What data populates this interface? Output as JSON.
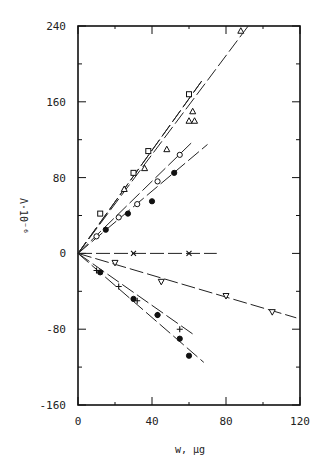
{
  "chart_data": {
    "type": "scatter",
    "title": "",
    "xlabel": "w, µg",
    "ylabel": "Λ·10⁻⁶",
    "xlim": [
      0,
      120
    ],
    "ylim": [
      -160,
      240
    ],
    "x_ticks": [
      0,
      40,
      80,
      120
    ],
    "y_ticks": [
      240,
      160,
      80,
      0,
      -80,
      -160
    ],
    "x_tick_labels": [
      "0",
      "40",
      "80",
      "120"
    ],
    "y_tick_labels": [
      "240",
      "160",
      "80",
      "0",
      "-80",
      "-160"
    ],
    "grid": false,
    "legend": "none",
    "series": [
      {
        "name": "open-triangle-steep",
        "marker": "triangle",
        "x": [
          60,
          62,
          63,
          88
        ],
        "y": [
          140,
          150,
          140,
          235
        ],
        "fit_end": [
          92,
          240
        ]
      },
      {
        "name": "open-square",
        "marker": "square",
        "x": [
          12,
          30,
          38,
          60
        ],
        "y": [
          42,
          85,
          108,
          168
        ],
        "fit_end": [
          68,
          185
        ]
      },
      {
        "name": "triangle-mid",
        "marker": "triangle",
        "x": [
          25,
          36,
          48
        ],
        "y": [
          68,
          90,
          110
        ],
        "fit_end": [
          68,
          185
        ]
      },
      {
        "name": "open-circle",
        "marker": "circle",
        "x": [
          10,
          22,
          32,
          43,
          55
        ],
        "y": [
          18,
          38,
          52,
          76,
          104
        ],
        "fit_end": [
          62,
          118
        ]
      },
      {
        "name": "filled-circle-pos",
        "marker": "filled-circle",
        "x": [
          15,
          27,
          40,
          52
        ],
        "y": [
          25,
          42,
          55,
          85
        ],
        "fit_end": [
          70,
          115
        ]
      },
      {
        "name": "cross-flat",
        "marker": "x",
        "x": [
          30,
          60
        ],
        "y": [
          0,
          0
        ],
        "fit_end": [
          75,
          0
        ]
      },
      {
        "name": "open-inverted-triangle",
        "marker": "triangle-down",
        "x": [
          20,
          45,
          80,
          105
        ],
        "y": [
          -10,
          -30,
          -45,
          -62
        ],
        "fit_end": [
          118,
          -68
        ]
      },
      {
        "name": "plus",
        "marker": "plus",
        "x": [
          10,
          22,
          32,
          43,
          55
        ],
        "y": [
          -18,
          -35,
          -50,
          -65,
          -80
        ],
        "fit_end": [
          62,
          -85
        ]
      },
      {
        "name": "filled-circle-neg",
        "marker": "filled-circle",
        "x": [
          12,
          30,
          43,
          55,
          60
        ],
        "y": [
          -20,
          -48,
          -65,
          -90,
          -108
        ],
        "fit_end": [
          68,
          -115
        ]
      }
    ]
  },
  "axes": {
    "xlabel": "w, µg",
    "ylabel": "Λ·10⁻⁶"
  }
}
